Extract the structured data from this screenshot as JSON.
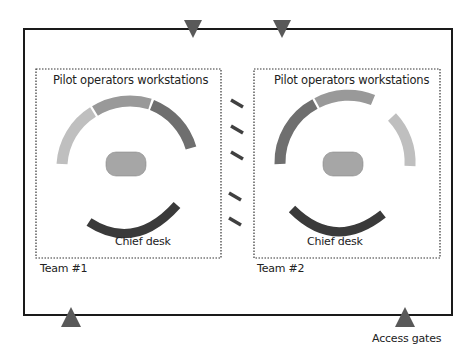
{
  "diagram": {
    "colors": {
      "frame": "#1a1a1a",
      "gate": "#595959",
      "seg_light": "#bfbfbf",
      "seg_medium": "#999999",
      "seg_dark": "#6f6f6f",
      "chief_desk": "#3a3a3a",
      "table": "#a6a6a6",
      "divider_dash": "#404040"
    },
    "teams": [
      {
        "label": "Team #1",
        "workstations_label": "Pilot operators workstations",
        "chief_desk_label": "Chief desk"
      },
      {
        "label": "Team #2",
        "workstations_label": "Pilot operators workstations",
        "chief_desk_label": "Chief desk"
      }
    ],
    "access_gates_label": "Access gates",
    "gate_count": 4
  }
}
